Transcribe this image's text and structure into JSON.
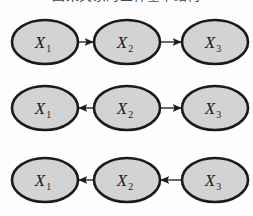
{
  "figure": {
    "background_color": "#fdfdfd",
    "top_text": "因果关系的三种基本结构",
    "node_fill": "#d3d3d3",
    "node_stroke": "#1a1a1a",
    "edge_color": "#1c1c1c"
  },
  "layout": {
    "columns_x": [
      45,
      127,
      215
    ],
    "rows_y": [
      42,
      108,
      180
    ],
    "node_rx": 33,
    "node_ry": 22
  },
  "graphs": [
    {
      "id": "chain-forward",
      "name": "chain",
      "row_index": 0,
      "nodes": [
        {
          "id": "x1",
          "base": "X",
          "sub": "1",
          "col": 0
        },
        {
          "id": "x2",
          "base": "X",
          "sub": "2",
          "col": 1
        },
        {
          "id": "x3",
          "base": "X",
          "sub": "3",
          "col": 2
        }
      ],
      "edges": [
        {
          "from": 0,
          "to": 1,
          "direction": "right"
        },
        {
          "from": 1,
          "to": 2,
          "direction": "right"
        }
      ]
    },
    {
      "id": "common-cause-fork",
      "name": "fork",
      "row_index": 1,
      "nodes": [
        {
          "id": "x1",
          "base": "X",
          "sub": "1",
          "col": 0
        },
        {
          "id": "x2",
          "base": "X",
          "sub": "2",
          "col": 1
        },
        {
          "id": "x3",
          "base": "X",
          "sub": "3",
          "col": 2
        }
      ],
      "edges": [
        {
          "from": 1,
          "to": 0,
          "direction": "left"
        },
        {
          "from": 1,
          "to": 2,
          "direction": "right"
        }
      ]
    },
    {
      "id": "chain-reverse",
      "name": "reverse-chain",
      "row_index": 2,
      "nodes": [
        {
          "id": "x1",
          "base": "X",
          "sub": "1",
          "col": 0
        },
        {
          "id": "x2",
          "base": "X",
          "sub": "2",
          "col": 1
        },
        {
          "id": "x3",
          "base": "X",
          "sub": "3",
          "col": 2
        }
      ],
      "edges": [
        {
          "from": 1,
          "to": 0,
          "direction": "left"
        },
        {
          "from": 2,
          "to": 1,
          "direction": "left"
        }
      ]
    }
  ]
}
